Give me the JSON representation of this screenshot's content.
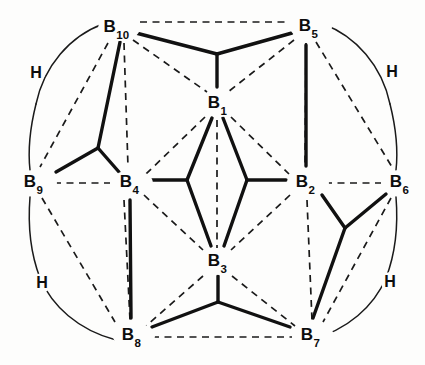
{
  "figure": {
    "background_color": "#fdfdfc",
    "line_color": "#111111",
    "width": 425,
    "height": 365
  },
  "vertices": [
    {
      "id": "B10",
      "element": "B",
      "index": "10",
      "x": 116,
      "y": 28
    },
    {
      "id": "B5",
      "element": "B",
      "index": "5",
      "x": 308,
      "y": 27
    },
    {
      "id": "B1",
      "element": "B",
      "index": "1",
      "x": 217,
      "y": 104
    },
    {
      "id": "B9",
      "element": "B",
      "index": "9",
      "x": 33,
      "y": 183
    },
    {
      "id": "B4",
      "element": "B",
      "index": "4",
      "x": 129,
      "y": 183
    },
    {
      "id": "B2",
      "element": "B",
      "index": "2",
      "x": 305,
      "y": 183
    },
    {
      "id": "B6",
      "element": "B",
      "index": "6",
      "x": 399,
      "y": 183
    },
    {
      "id": "B3",
      "element": "B",
      "index": "3",
      "x": 217,
      "y": 262
    },
    {
      "id": "B8",
      "element": "B",
      "index": "8",
      "x": 131,
      "y": 336
    },
    {
      "id": "B7",
      "element": "B",
      "index": "7",
      "x": 310,
      "y": 336
    }
  ],
  "hydrogen_labels": [
    {
      "id": "H-upper-left",
      "text": "H",
      "x": 36,
      "y": 73
    },
    {
      "id": "H-upper-right",
      "text": "H",
      "x": 392,
      "y": 72
    },
    {
      "id": "H-lower-left",
      "text": "H",
      "x": 42,
      "y": 283
    },
    {
      "id": "H-lower-right",
      "text": "H",
      "x": 390,
      "y": 282
    }
  ],
  "dashed_bonds": [
    {
      "from": "B10",
      "to": "B5",
      "x1": 140,
      "y1": 22,
      "x2": 290,
      "y2": 22
    },
    {
      "from": "B9",
      "to": "B4",
      "x1": 54,
      "y1": 183,
      "x2": 110,
      "y2": 183
    },
    {
      "from": "B2",
      "to": "B6",
      "x1": 325,
      "y1": 183,
      "x2": 381,
      "y2": 183
    },
    {
      "from": "B8",
      "to": "B7",
      "x1": 152,
      "y1": 337,
      "x2": 292,
      "y2": 337
    },
    {
      "from": "B10",
      "to": "B9",
      "x1": 108,
      "y1": 43,
      "x2": 40,
      "y2": 167
    },
    {
      "from": "B10",
      "to": "B4",
      "x1": 124,
      "y1": 43,
      "x2": 128,
      "y2": 167
    },
    {
      "from": "B10",
      "to": "B1",
      "x1": 133,
      "y1": 40,
      "x2": 207,
      "y2": 92
    },
    {
      "from": "B5",
      "to": "B1",
      "x1": 294,
      "y1": 40,
      "x2": 228,
      "y2": 92
    },
    {
      "from": "B5",
      "to": "B6",
      "x1": 316,
      "y1": 42,
      "x2": 392,
      "y2": 167
    },
    {
      "from": "B5",
      "to": "B2",
      "x1": 306,
      "y1": 43,
      "x2": 305,
      "y2": 167
    },
    {
      "from": "B1",
      "to": "B4",
      "x1": 205,
      "y1": 117,
      "x2": 146,
      "y2": 174
    },
    {
      "from": "B1",
      "to": "B2",
      "x1": 231,
      "y1": 117,
      "x2": 289,
      "y2": 174
    },
    {
      "from": "B1",
      "to": "B3",
      "x1": 217,
      "y1": 120,
      "x2": 217,
      "y2": 248
    },
    {
      "from": "B4",
      "to": "B3",
      "x1": 144,
      "y1": 195,
      "x2": 203,
      "y2": 250
    },
    {
      "from": "B2",
      "to": "B3",
      "x1": 290,
      "y1": 195,
      "x2": 231,
      "y2": 250
    },
    {
      "from": "B4",
      "to": "B8",
      "x1": 124,
      "y1": 200,
      "x2": 130,
      "y2": 320
    },
    {
      "from": "B9",
      "to": "B8",
      "x1": 42,
      "y1": 198,
      "x2": 115,
      "y2": 322
    },
    {
      "from": "B3",
      "to": "B8",
      "x1": 203,
      "y1": 276,
      "x2": 146,
      "y2": 326
    },
    {
      "from": "B3",
      "to": "B7",
      "x1": 232,
      "y1": 276,
      "x2": 295,
      "y2": 326
    },
    {
      "from": "B2",
      "to": "B7",
      "x1": 307,
      "y1": 200,
      "x2": 312,
      "y2": 320
    },
    {
      "from": "B6",
      "to": "B7",
      "x1": 391,
      "y1": 198,
      "x2": 323,
      "y2": 322
    }
  ],
  "solid_bonds": [
    {
      "from": "B5",
      "to": "B2",
      "x1": 306,
      "y1": 45,
      "x2": 306,
      "y2": 166
    },
    {
      "from": "B4",
      "to": "B8",
      "x1": 130,
      "y1": 200,
      "x2": 131,
      "y2": 318
    }
  ],
  "bridge_bonds": [
    {
      "id": "bridge-B10-B5-B1",
      "description": "three-centre bridge joining B10, B5 and B1",
      "junction_x": 217,
      "junction_y": 54,
      "arms": [
        {
          "to": "B10",
          "x": 136,
          "y": 33
        },
        {
          "to": "B5",
          "x": 292,
          "y": 33
        },
        {
          "to": "B1",
          "x": 217,
          "y": 87
        }
      ]
    },
    {
      "id": "bridge-B10-B9-B4",
      "description": "three-centre bridge joining B10, B9 and B4",
      "junction_x": 98,
      "junction_y": 148,
      "arms": [
        {
          "to": "B10",
          "x": 120,
          "y": 42
        },
        {
          "to": "B9",
          "x": 56,
          "y": 172
        },
        {
          "to": "B4",
          "x": 119,
          "y": 172
        }
      ]
    },
    {
      "id": "bridge-B1-B4-B3",
      "description": "three-centre bridge joining B1, B4 and B3",
      "junction_x": 187,
      "junction_y": 180,
      "arms": [
        {
          "to": "B1",
          "x": 212,
          "y": 118
        },
        {
          "to": "B4",
          "x": 150,
          "y": 180
        },
        {
          "to": "B3",
          "x": 211,
          "y": 246
        }
      ]
    },
    {
      "id": "bridge-B1-B2-B3",
      "description": "three-centre bridge joining B1, B2 and B3",
      "junction_x": 247,
      "junction_y": 180,
      "arms": [
        {
          "to": "B1",
          "x": 223,
          "y": 118
        },
        {
          "to": "B2",
          "x": 286,
          "y": 180
        },
        {
          "to": "B3",
          "x": 224,
          "y": 246
        }
      ]
    },
    {
      "id": "bridge-B2-B6-B7",
      "description": "three-centre bridge joining B2, B6 and B7",
      "junction_x": 345,
      "junction_y": 228,
      "arms": [
        {
          "to": "B2",
          "x": 322,
          "y": 195
        },
        {
          "to": "B6",
          "x": 386,
          "y": 194
        },
        {
          "to": "B7",
          "x": 313,
          "y": 318
        }
      ]
    },
    {
      "id": "bridge-B3-B8-B7",
      "description": "three-centre bridge joining B3, B8 and B7",
      "junction_x": 218,
      "junction_y": 302,
      "arms": [
        {
          "to": "B3",
          "x": 218,
          "y": 276
        },
        {
          "to": "B8",
          "x": 152,
          "y": 327
        },
        {
          "to": "B7",
          "x": 290,
          "y": 327
        }
      ]
    }
  ],
  "bridge_arcs": [
    {
      "id": "arc-upper-left",
      "path": "M 103 24 C 70 36 44 66 36 104",
      "label": "H-upper-left"
    },
    {
      "id": "arc-left-upper-tail",
      "path": "M 36 104 C 30 128 28 152 30 170",
      "label": "H-upper-left"
    },
    {
      "id": "arc-upper-right",
      "path": "M 323 24 C 356 36 382 66 390 104",
      "label": "H-upper-right"
    },
    {
      "id": "arc-right-upper-tail",
      "path": "M 390 104 C 396 128 398 152 396 170",
      "label": "H-upper-right"
    },
    {
      "id": "arc-lower-left",
      "path": "M 30 197 C 28 222 30 252 40 278",
      "label": "H-lower-left"
    },
    {
      "id": "arc-left-lower-tail",
      "path": "M 40 278 C 52 306 78 330 116 340",
      "label": "H-lower-left"
    },
    {
      "id": "arc-lower-right",
      "path": "M 396 197 C 398 222 396 252 386 278",
      "label": "H-lower-right"
    },
    {
      "id": "arc-right-lower-tail",
      "path": "M 386 278 C 374 306 348 330 310 340",
      "label": "H-lower-right"
    }
  ]
}
